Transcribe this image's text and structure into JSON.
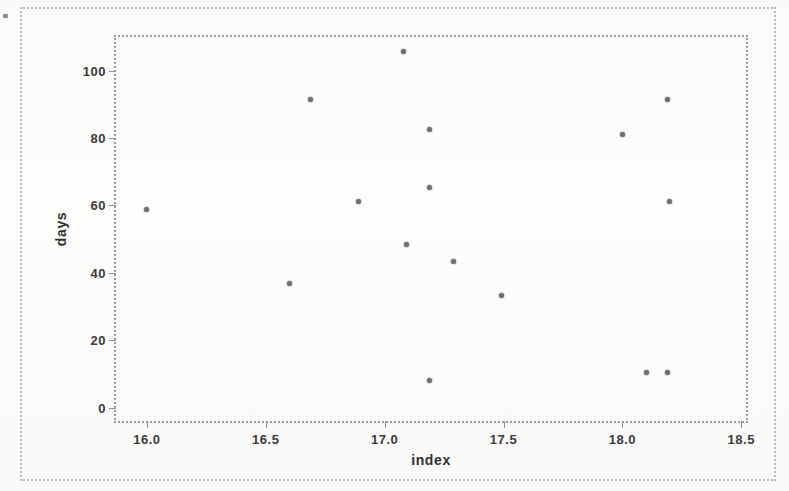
{
  "chart_data": {
    "type": "scatter",
    "title": "",
    "xlabel": "index",
    "ylabel": "days",
    "xlim": [
      15.87,
      18.52
    ],
    "ylim": [
      -4,
      110
    ],
    "grid": false,
    "legend": null,
    "xticks": [
      {
        "value": 16.0,
        "label": "16.0"
      },
      {
        "value": 16.5,
        "label": "16.5"
      },
      {
        "value": 17.0,
        "label": "17.0"
      },
      {
        "value": 17.5,
        "label": "17.5"
      },
      {
        "value": 18.0,
        "label": "18.0"
      },
      {
        "value": 18.5,
        "label": "18.5"
      }
    ],
    "yticks": [
      {
        "value": 0,
        "label": "0"
      },
      {
        "value": 20,
        "label": "20"
      },
      {
        "value": 40,
        "label": "40"
      },
      {
        "value": 60,
        "label": "60"
      },
      {
        "value": 80,
        "label": "80"
      },
      {
        "value": 100,
        "label": "100"
      }
    ],
    "marker_color": "#6f6f72",
    "points": [
      {
        "x": 16.0,
        "y": 58.7
      },
      {
        "x": 16.6,
        "y": 36.7
      },
      {
        "x": 16.69,
        "y": 91.5
      },
      {
        "x": 16.89,
        "y": 61.3
      },
      {
        "x": 17.08,
        "y": 105.6
      },
      {
        "x": 17.19,
        "y": 82.4
      },
      {
        "x": 17.19,
        "y": 65.4
      },
      {
        "x": 17.09,
        "y": 48.4
      },
      {
        "x": 17.29,
        "y": 43.4
      },
      {
        "x": 17.19,
        "y": 7.9
      },
      {
        "x": 17.49,
        "y": 33.4
      },
      {
        "x": 18.0,
        "y": 81.2
      },
      {
        "x": 18.1,
        "y": 10.3
      },
      {
        "x": 18.19,
        "y": 91.5
      },
      {
        "x": 18.2,
        "y": 61.3
      },
      {
        "x": 18.19,
        "y": 10.3
      }
    ]
  }
}
